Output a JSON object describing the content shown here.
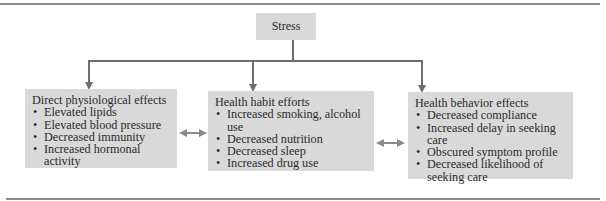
{
  "root": {
    "label": "Stress"
  },
  "boxes": [
    {
      "title": "Direct physiological effects",
      "items": [
        "Elevated lipids",
        "Elevated blood pressure",
        "Decreased immunity",
        "Increased hormonal activity"
      ]
    },
    {
      "title": "Health habit efforts",
      "items": [
        "Increased smoking, alcohol use",
        "Decreased nutrition",
        "Decreased sleep",
        "Increased drug use"
      ]
    },
    {
      "title": "Health behavior effects",
      "items": [
        "Decreased compliance",
        "Increased delay in seeking care",
        "Obscured symptom profile",
        "Decreased likelihood of seeking care"
      ]
    }
  ],
  "colors": {
    "box_fill": "#d9d9d9",
    "line": "#7a7a7a",
    "rule": "#8c8c8c"
  }
}
